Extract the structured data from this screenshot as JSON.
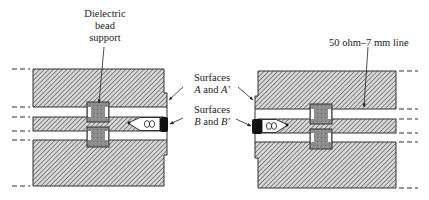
{
  "figure": {
    "labels": {
      "bead_line1": "Dielectric",
      "bead_line2": "bead",
      "bead_line3": "support",
      "line": "50 ohm–7 mm line",
      "surfaces_a_1": "Surfaces",
      "surfaces_a_2a": "A",
      "surfaces_a_2b": " and ",
      "surfaces_a_2c": "A′",
      "surfaces_b_1": "Surfaces",
      "surfaces_b_2a": "B",
      "surfaces_b_2b": " and ",
      "surfaces_b_2c": "B′"
    },
    "colors": {
      "hatch": "#555555",
      "outline": "#333333",
      "bead": "#8a8a8a",
      "contact": "#111111",
      "background": "#ffffff"
    }
  }
}
